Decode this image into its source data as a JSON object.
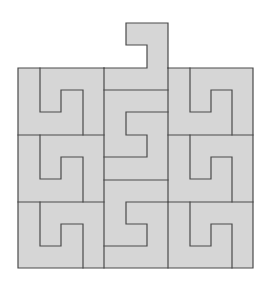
{
  "diagram": {
    "type": "tiling-puzzle",
    "colors": {
      "fill": "#d6d6d6",
      "stroke": "#4a4a4a",
      "background": "#ffffff"
    },
    "grid": {
      "columns": 3,
      "rows": 3,
      "bounds": {
        "left": 18,
        "top": 68,
        "right": 253,
        "bottom": 268
      }
    },
    "pieces": [
      {
        "id": "top-hook",
        "column": "middle",
        "row": "above"
      },
      {
        "id": "r1-left",
        "column": "left",
        "row": 1
      },
      {
        "id": "r1-middle",
        "column": "middle",
        "row": 1
      },
      {
        "id": "r1-right",
        "column": "right",
        "row": 1
      },
      {
        "id": "r2-left",
        "column": "left",
        "row": 2
      },
      {
        "id": "r2-middle",
        "column": "middle",
        "row": 2
      },
      {
        "id": "r2-right",
        "column": "right",
        "row": 2
      },
      {
        "id": "r3-left",
        "column": "left",
        "row": 3
      },
      {
        "id": "r3-middle",
        "column": "middle",
        "row": 3
      },
      {
        "id": "r3-right",
        "column": "right",
        "row": 3
      }
    ]
  }
}
